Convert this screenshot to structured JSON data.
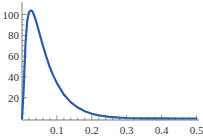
{
  "chart_data": {
    "type": "line",
    "title": "",
    "xlabel": "",
    "ylabel": "",
    "xlim": [
      0,
      0.5
    ],
    "ylim": [
      0,
      105
    ],
    "grid": false,
    "legend": null,
    "x_ticks": [
      "0.1",
      "0.2",
      "0.3",
      "0.4",
      "0.5"
    ],
    "x_tick_values": [
      0.1,
      0.2,
      0.3,
      0.4,
      0.5
    ],
    "y_ticks": [
      "20",
      "40",
      "60",
      "80",
      "100"
    ],
    "y_tick_values": [
      20,
      40,
      60,
      80,
      100
    ],
    "series": [
      {
        "name": "density",
        "color": "#2a5da8",
        "x": [
          0.0,
          0.005,
          0.01,
          0.015,
          0.02,
          0.025,
          0.03,
          0.035,
          0.04,
          0.05,
          0.06,
          0.07,
          0.08,
          0.09,
          0.1,
          0.12,
          0.14,
          0.16,
          0.18,
          0.2,
          0.22,
          0.25,
          0.28,
          0.3,
          0.35,
          0.4,
          0.45,
          0.5
        ],
        "y": [
          0,
          30,
          72,
          94,
          102,
          104,
          103,
          99,
          94,
          82,
          70,
          59,
          49,
          41,
          34,
          23,
          15.5,
          10.5,
          7,
          4.6,
          3.0,
          1.6,
          0.8,
          0.5,
          0.15,
          0.05,
          0.01,
          0
        ]
      }
    ]
  },
  "axes": {
    "x_labels": [
      "0.1",
      "0.2",
      "0.3",
      "0.4",
      "0.5"
    ],
    "y_labels": [
      "20",
      "40",
      "60",
      "80",
      "100"
    ]
  }
}
